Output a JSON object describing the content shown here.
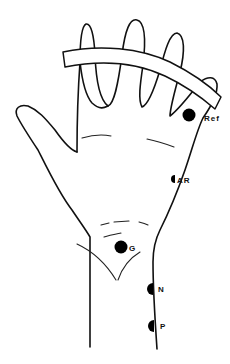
{
  "figure": {
    "colors": {
      "line": "#111111",
      "electrode": "#000000",
      "background": "#ffffff"
    },
    "electrodes": [
      {
        "id": "ref",
        "label": "Ref"
      },
      {
        "id": "ar",
        "label": "AR"
      },
      {
        "id": "g",
        "label": "G"
      },
      {
        "id": "n",
        "label": "N"
      },
      {
        "id": "p",
        "label": "P"
      }
    ],
    "band": {
      "description": "strap across fingers"
    }
  }
}
